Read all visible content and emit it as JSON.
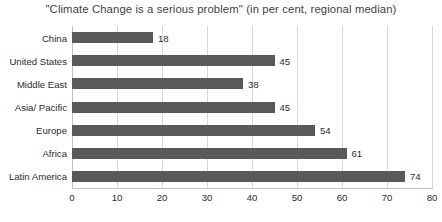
{
  "chart_data": {
    "type": "bar",
    "orientation": "horizontal",
    "title": "\"Climate Change is a serious problem\" (in per cent, regional median)",
    "xlabel": "",
    "ylabel": "",
    "xlim": [
      0,
      80
    ],
    "xticks": [
      0,
      10,
      20,
      30,
      40,
      50,
      60,
      70,
      80
    ],
    "xtick_labels": [
      "0",
      "10",
      "20",
      "30",
      "40",
      "50",
      "60",
      "70",
      "80"
    ],
    "grid": true,
    "legend": false,
    "categories": [
      "China",
      "United States",
      "Middle East",
      "Asia/ Pacific",
      "Europe",
      "Africa",
      "Latin America"
    ],
    "values": [
      18,
      45,
      38,
      45,
      54,
      61,
      74
    ],
    "data_labels": [
      "18",
      "45",
      "38",
      "45",
      "54",
      "61",
      "74"
    ],
    "colors": {
      "bar": "#595959",
      "grid": "#d9d9d9",
      "axis": "#c2c2c2",
      "title_text": "#3f3f3f",
      "label_text": "#2b2b2b",
      "background": "#ffffff"
    }
  }
}
